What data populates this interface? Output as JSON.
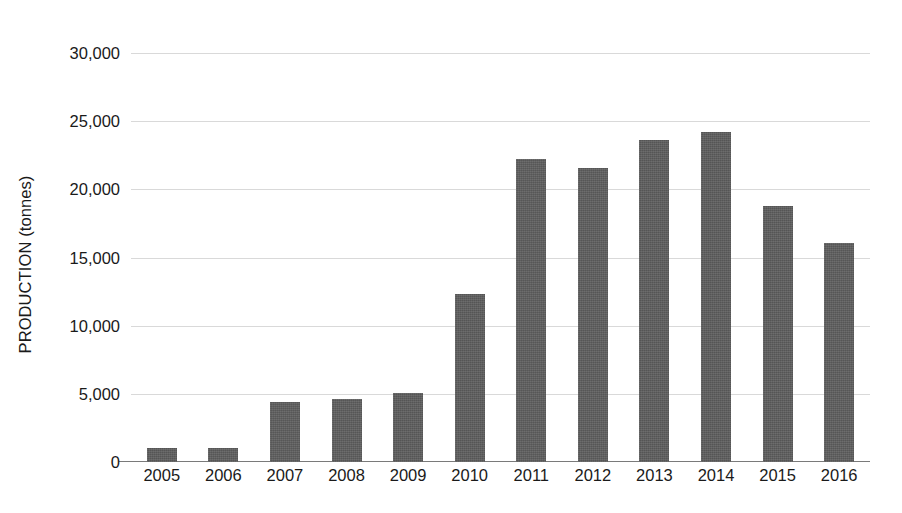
{
  "chart_data": {
    "type": "bar",
    "title": "",
    "subtitle": "",
    "xlabel": "",
    "ylabel": "PRODUCTION (tonnes)",
    "categories": [
      "2005",
      "2006",
      "2007",
      "2008",
      "2009",
      "2010",
      "2011",
      "2012",
      "2013",
      "2014",
      "2015",
      "2016"
    ],
    "values": [
      1000,
      1050,
      4400,
      4650,
      5050,
      12300,
      22200,
      21600,
      23600,
      24200,
      18800,
      16100
    ],
    "series": [
      {
        "name": "Production",
        "values": [
          1000,
          1050,
          4400,
          4650,
          5050,
          12300,
          22200,
          21600,
          23600,
          24200,
          18800,
          16100
        ]
      }
    ],
    "ylim": [
      0,
      30000
    ],
    "ytick_values": [
      0,
      5000,
      10000,
      15000,
      20000,
      25000,
      30000
    ],
    "ytick_labels": [
      "0",
      "5,000",
      "10,000",
      "15,000",
      "20,000",
      "25,000",
      "30,000"
    ],
    "grid": true,
    "grid_axis": "y",
    "legend": false,
    "legend_position": "none",
    "bar_color": "#5e5e5e",
    "gridline_color": "#d9d9d9",
    "axis_color": "#7a7a7a",
    "background_color": "#ffffff",
    "annotations": []
  }
}
